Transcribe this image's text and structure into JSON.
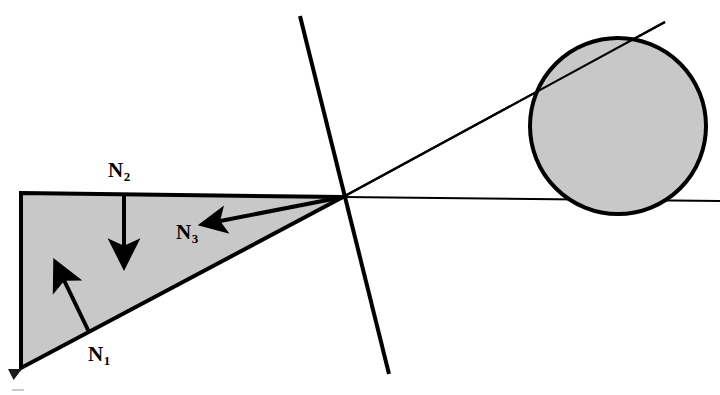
{
  "figure": {
    "type": "geometry-diagram",
    "title": "",
    "background_color": "#ffffff",
    "stroke_color": "#000000",
    "fill_color": "#c8c8c8",
    "width": 720,
    "height": 395
  },
  "labels": {
    "n1": {
      "base": "N",
      "sub": "1",
      "x": 88,
      "y": 344
    },
    "n2": {
      "base": "N",
      "sub": "2",
      "x": 108,
      "y": 160
    },
    "n3": {
      "base": "N",
      "sub": "3",
      "x": 176,
      "y": 222
    }
  },
  "shapes": {
    "wedge": {
      "name": "shaded-triangle",
      "points": "21,193 343,197 21,368",
      "fill": "#c8c8c8",
      "stroke": "#000000",
      "stroke_width": 4
    },
    "circle": {
      "name": "shaded-circle",
      "cx": 618,
      "cy": 126,
      "r": 88,
      "fill": "#c8c8c8",
      "stroke": "#000000",
      "stroke_width": 4
    }
  },
  "lines": {
    "steep": {
      "name": "steep-line",
      "x1": 300,
      "y1": 16,
      "x2": 389,
      "y2": 374,
      "stroke_width": 4
    },
    "horizontal_tangent": {
      "name": "horizontal-tangent-line",
      "x1": 343,
      "y1": 197,
      "x2": 720,
      "y2": 201,
      "stroke_width": 2
    },
    "diagonal_secant": {
      "name": "diagonal-secant-line",
      "x1": 343,
      "y1": 197,
      "x2": 665,
      "y2": 22,
      "stroke_width": 2
    }
  },
  "arrows": {
    "n1": {
      "name": "n1-normal-arrow",
      "x1": 89,
      "y1": 332,
      "x2": 59,
      "y2": 270,
      "stroke_width": 4
    },
    "n2": {
      "name": "n2-normal-arrow",
      "x1": 124,
      "y1": 193,
      "x2": 124,
      "y2": 258,
      "stroke_width": 4
    },
    "n3": {
      "name": "n3-normal-arrow",
      "x1": 343,
      "y1": 197,
      "x2": 207,
      "y2": 224,
      "stroke_width": 4
    }
  }
}
